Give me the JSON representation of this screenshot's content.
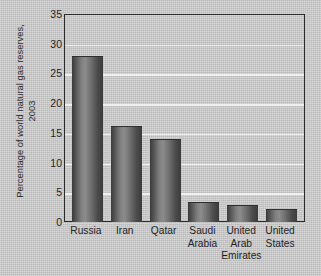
{
  "chart_data": {
    "type": "bar",
    "title": "",
    "xlabel": "",
    "ylabel": "Percentage of world natural gas reserves, 2003",
    "ylabel_lines": [
      "Percentage of world natural gas reserves,",
      "2003"
    ],
    "categories": [
      "Russia",
      "Iran",
      "Qatar",
      "Saudi Arabia",
      "United Arab Emirates",
      "United States"
    ],
    "category_lines": [
      [
        "Russia"
      ],
      [
        "Iran"
      ],
      [
        "Qatar"
      ],
      [
        "Saudi",
        "Arabia"
      ],
      [
        "United",
        "Arab",
        "Emirates"
      ],
      [
        "United",
        "States"
      ]
    ],
    "values": [
      28.0,
      16.1,
      13.9,
      3.4,
      2.8,
      2.2
    ],
    "ylim": [
      0,
      35
    ],
    "yticks": [
      0,
      5,
      10,
      15,
      20,
      25,
      30,
      35
    ],
    "ytick_labels": [
      "0",
      "5",
      "10",
      "15",
      "20",
      "25",
      "30",
      "35"
    ],
    "grid": true,
    "grid_axis": "y",
    "grid_color": "#efefef",
    "legend": false,
    "bar_color": "#808080",
    "bar_style": "vertical-gradient-grayscale",
    "background_color": "#c9c9c9",
    "axis_color": "#2b2b2b"
  }
}
